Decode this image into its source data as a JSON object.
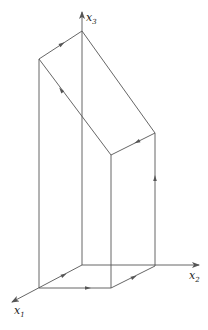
{
  "figure": {
    "type": "3d-path-diagram",
    "colors": {
      "line": "#555555",
      "text": "#222222",
      "background": "#ffffff"
    },
    "axes": [
      {
        "id": "x1",
        "label": "x",
        "subscript": "1",
        "from": [
          82,
          265
        ],
        "to": [
          11,
          303
        ],
        "label_pos": [
          14,
          314
        ],
        "sub_pos": [
          22,
          317
        ]
      },
      {
        "id": "x2",
        "label": "x",
        "subscript": "2",
        "from": [
          82,
          265
        ],
        "to": [
          199,
          265
        ],
        "label_pos": [
          189,
          279
        ],
        "sub_pos": [
          196,
          282
        ]
      },
      {
        "id": "x3",
        "label": "x",
        "subscript": "3",
        "from": [
          82,
          265
        ],
        "to": [
          82,
          12
        ],
        "label_pos": [
          86,
          21
        ],
        "sub_pos": [
          93,
          24
        ]
      }
    ],
    "points": {
      "O": [
        82,
        265
      ],
      "A": [
        39,
        288
      ],
      "B": [
        111,
        288
      ],
      "C": [
        155,
        266
      ],
      "L": [
        39,
        59
      ],
      "P": [
        82,
        31
      ],
      "R": [
        155,
        133
      ],
      "F": [
        111,
        155
      ]
    },
    "edges": [
      {
        "id": "A-O",
        "from": "A",
        "to": "O"
      },
      {
        "id": "A-B",
        "from": "A",
        "to": "B"
      },
      {
        "id": "B-C",
        "from": "B",
        "to": "C"
      },
      {
        "id": "C-O",
        "from": "C",
        "to": "O"
      },
      {
        "id": "A-L",
        "from": "A",
        "to": "L"
      },
      {
        "id": "B-F",
        "from": "B",
        "to": "F"
      },
      {
        "id": "C-R",
        "from": "C",
        "to": "R"
      },
      {
        "id": "L-P",
        "from": "L",
        "to": "P"
      },
      {
        "id": "P-R",
        "from": "P",
        "to": "R"
      },
      {
        "id": "R-F",
        "from": "R",
        "to": "F"
      },
      {
        "id": "F-L",
        "from": "F",
        "to": "L"
      }
    ],
    "arrows": [
      {
        "on": "L-P",
        "at": [
          62,
          44
        ],
        "direction": "toward P"
      },
      {
        "on": "R-F",
        "at": [
          137,
          142
        ],
        "direction": "toward F"
      },
      {
        "on": "F-L",
        "at": [
          61,
          90
        ],
        "direction": "toward L"
      },
      {
        "on": "C-R",
        "at": [
          155,
          178
        ],
        "direction": "up"
      },
      {
        "on": "A-O",
        "at": [
          64,
          275
        ],
        "direction": "toward O"
      },
      {
        "on": "A-B",
        "at": [
          88,
          288
        ],
        "direction": "right"
      },
      {
        "on": "B-C",
        "at": [
          134,
          277
        ],
        "direction": "toward C"
      }
    ]
  },
  "labels": {
    "x1": "x",
    "x1_sub": "1",
    "x2": "x",
    "x2_sub": "2",
    "x3": "x",
    "x3_sub": "3"
  }
}
